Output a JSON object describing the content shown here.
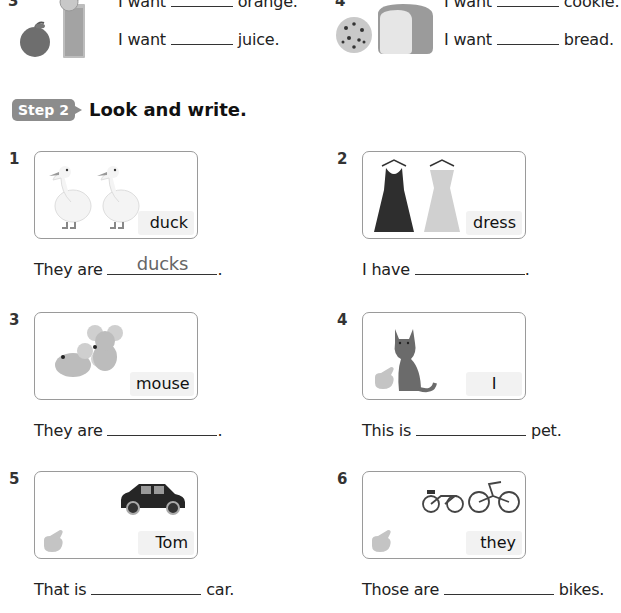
{
  "top_section": {
    "items": [
      {
        "number": "3",
        "lines": [
          {
            "before": "I want",
            "after": "orange."
          },
          {
            "before": "I want",
            "after": "juice."
          }
        ],
        "image": "orange-and-juice"
      },
      {
        "number": "4",
        "lines": [
          {
            "before": "I want",
            "after": "cookie."
          },
          {
            "before": "I want",
            "after": "bread."
          }
        ],
        "image": "cookie-and-bread"
      }
    ]
  },
  "step": {
    "badge": "Step 2",
    "title": "Look and write."
  },
  "exercises": [
    {
      "number": "1",
      "image": "two-ducks",
      "cue": "duck",
      "before": "They are",
      "answer": "ducks",
      "after": "."
    },
    {
      "number": "2",
      "image": "two-dresses",
      "cue": "dress",
      "before": "I have",
      "answer": "",
      "after": "."
    },
    {
      "number": "3",
      "image": "two-mice",
      "cue": "mouse",
      "before": "They are",
      "answer": "",
      "after": "."
    },
    {
      "number": "4",
      "image": "cat-with-pointing-hand",
      "cue": "I",
      "before": "This is",
      "answer": "",
      "after": "pet."
    },
    {
      "number": "5",
      "image": "car-with-pointing-hand",
      "cue": "Tom",
      "before": "That is",
      "answer": "",
      "after": "car."
    },
    {
      "number": "6",
      "image": "bikes-with-pointing-hand",
      "cue": "they",
      "before": "Those are",
      "answer": "",
      "after": "bikes."
    }
  ]
}
